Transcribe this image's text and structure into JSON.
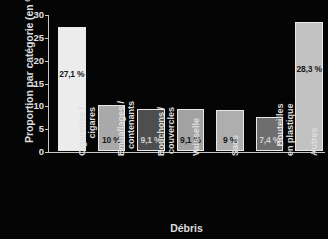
{
  "chart_data": {
    "type": "bar",
    "title": "",
    "xlabel": "Débris",
    "ylabel": "Proportion par catégorie (en %)",
    "ylim": [
      0,
      30
    ],
    "yticks": [
      "0",
      "5",
      "10",
      "15",
      "20",
      "25",
      "30"
    ],
    "grid": false,
    "legend": "none",
    "categories": [
      "Cigarettes / cigares",
      "Emballages / contenants",
      "Bouchons / couvercles",
      "Vaisselle",
      "Sacs",
      "Bouteilles en plastique",
      "Autres"
    ],
    "category_lines": [
      [
        "Cigarettes /",
        "cigares"
      ],
      [
        "Emballages /",
        "contenants"
      ],
      [
        "Bouchons /",
        "couvercles"
      ],
      [
        "Vaisselle"
      ],
      [
        "Sacs"
      ],
      [
        "Bouteilles",
        "en plastique"
      ],
      [
        "Autres"
      ]
    ],
    "values": [
      27.1,
      10,
      9.1,
      9.1,
      9,
      7.4,
      28.3
    ],
    "value_labels": [
      "27,1 %",
      "10 %",
      "9,1 %",
      "9,1 %",
      "9 %",
      "7,4 %",
      "28,3 %"
    ],
    "bar_colors": [
      "#ececed",
      "#a9a9a9",
      "#4e4e4e",
      "#a2a2a2",
      "#aeaeae",
      "#6e6e6e",
      "#c2c2c2"
    ],
    "label_on_dark": [
      false,
      false,
      true,
      false,
      false,
      true,
      false
    ],
    "background_color": "#050505",
    "axis_color": "#c9c9c9",
    "text_color": "#dedede"
  }
}
